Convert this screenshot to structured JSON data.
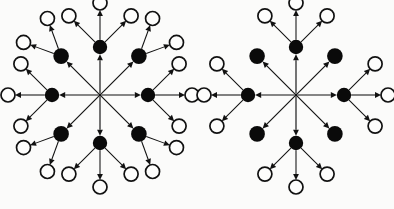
{
  "figure": {
    "background_color": "#fbfbfa",
    "ink_color": "#111111",
    "node_fill_black": "#0a0a0a",
    "node_fill_white": "#fdfdfc",
    "width": 394,
    "height": 209,
    "panel_count": 2,
    "caption": ""
  },
  "geometry": {
    "black_node_radius": 7.2,
    "diagonal_black_node_radius": 7.8,
    "white_node_radius": 7.0,
    "hub_dot_radius": 1.6,
    "axial_ring_radius": 48,
    "diagonal_ring_radius": 55,
    "leaf_offset_axial": 44,
    "leaf_offset_diagonal": 40,
    "arrow_head_length": 6.0,
    "arrow_head_half_width": 2.9
  },
  "panels": [
    {
      "id": "left-panel",
      "name": "left-diagram",
      "label": "",
      "center": {
        "x": 100,
        "y": 95
      },
      "hub": {
        "name": "hub-node",
        "visible_marker": "convergence-point",
        "out_degree": 8
      },
      "black_nodes": [
        {
          "id": "L-N",
          "name": "black-node-north",
          "angle_deg": 270,
          "ring": "axial",
          "leaf_angles_deg": [
            270,
            225,
            315
          ],
          "leaf_count": 3
        },
        {
          "id": "L-NE",
          "name": "black-node-northeast",
          "angle_deg": 315,
          "ring": "diagonal",
          "leaf_angles_deg": [
            290,
            340
          ],
          "leaf_count": 2
        },
        {
          "id": "L-E",
          "name": "black-node-east",
          "angle_deg": 0,
          "ring": "axial",
          "leaf_angles_deg": [
            0,
            315,
            45
          ],
          "leaf_count": 3
        },
        {
          "id": "L-SE",
          "name": "black-node-southeast",
          "angle_deg": 45,
          "ring": "diagonal",
          "leaf_angles_deg": [
            20,
            70
          ],
          "leaf_count": 2
        },
        {
          "id": "L-S",
          "name": "black-node-south",
          "angle_deg": 90,
          "ring": "axial",
          "leaf_angles_deg": [
            90,
            45,
            135
          ],
          "leaf_count": 3
        },
        {
          "id": "L-SW",
          "name": "black-node-southwest",
          "angle_deg": 135,
          "ring": "diagonal",
          "leaf_angles_deg": [
            110,
            160
          ],
          "leaf_count": 2
        },
        {
          "id": "L-W",
          "name": "black-node-west",
          "angle_deg": 180,
          "ring": "axial",
          "leaf_angles_deg": [
            180,
            135,
            225
          ],
          "leaf_count": 3
        },
        {
          "id": "L-NW",
          "name": "black-node-northwest",
          "angle_deg": 225,
          "ring": "diagonal",
          "leaf_angles_deg": [
            200,
            250
          ],
          "leaf_count": 2
        }
      ],
      "counts": {
        "black_nodes": 8,
        "white_nodes": 20,
        "hub_edges": 8,
        "leaf_edges": 20,
        "total_edges": 28
      }
    },
    {
      "id": "right-panel",
      "name": "right-diagram",
      "label": "",
      "center": {
        "x": 296,
        "y": 95
      },
      "hub": {
        "name": "hub-node",
        "visible_marker": "convergence-point",
        "out_degree": 8
      },
      "black_nodes": [
        {
          "id": "R-N",
          "name": "black-node-north",
          "angle_deg": 270,
          "ring": "axial",
          "leaf_angles_deg": [
            270,
            225,
            315
          ],
          "leaf_count": 3
        },
        {
          "id": "R-NE",
          "name": "black-node-northeast",
          "angle_deg": 315,
          "ring": "diagonal",
          "leaf_angles_deg": [],
          "leaf_count": 0
        },
        {
          "id": "R-E",
          "name": "black-node-east",
          "angle_deg": 0,
          "ring": "axial",
          "leaf_angles_deg": [
            0,
            315,
            45
          ],
          "leaf_count": 3
        },
        {
          "id": "R-SE",
          "name": "black-node-southeast",
          "angle_deg": 45,
          "ring": "diagonal",
          "leaf_angles_deg": [],
          "leaf_count": 0
        },
        {
          "id": "R-S",
          "name": "black-node-south",
          "angle_deg": 90,
          "ring": "axial",
          "leaf_angles_deg": [
            90,
            45,
            135
          ],
          "leaf_count": 3
        },
        {
          "id": "R-SW",
          "name": "black-node-southwest",
          "angle_deg": 135,
          "ring": "diagonal",
          "leaf_angles_deg": [],
          "leaf_count": 0
        },
        {
          "id": "R-W",
          "name": "black-node-west",
          "angle_deg": 180,
          "ring": "axial",
          "leaf_angles_deg": [
            180,
            135,
            225
          ],
          "leaf_count": 3
        },
        {
          "id": "R-NW",
          "name": "black-node-northwest",
          "angle_deg": 225,
          "ring": "diagonal",
          "leaf_angles_deg": [],
          "leaf_count": 0
        }
      ],
      "counts": {
        "black_nodes": 8,
        "white_nodes": 12,
        "hub_edges": 8,
        "leaf_edges": 12,
        "total_edges": 20
      }
    }
  ]
}
